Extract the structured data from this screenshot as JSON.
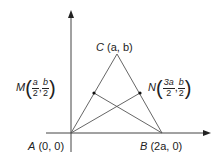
{
  "diagram": {
    "type": "coordinate-geometry-triangle",
    "points": {
      "A": {
        "name": "A",
        "coords": "(0, 0)"
      },
      "B": {
        "name": "B",
        "coords": "(2a, 0)"
      },
      "C": {
        "name": "C",
        "coords": "(a, b)"
      },
      "M": {
        "name": "M",
        "x_num": "a",
        "x_den": "2",
        "y_num": "b",
        "y_den": "2"
      },
      "N": {
        "name": "N",
        "x_num": "3a",
        "x_den": "2",
        "y_num": "b",
        "y_den": "2"
      }
    },
    "segments": [
      "AC",
      "BC",
      "AB",
      "AN",
      "BM"
    ],
    "axes": [
      "x-axis",
      "y-axis"
    ],
    "colors": {
      "line": "#444444",
      "point": "#111111"
    }
  }
}
